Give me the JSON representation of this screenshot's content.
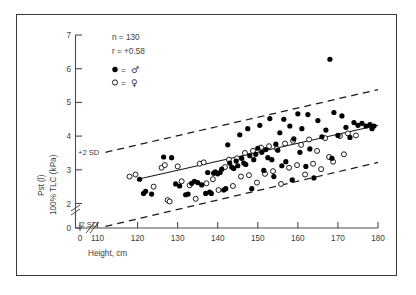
{
  "figure": {
    "background_color": "#ffffff",
    "frame_color": "#3a3a3a"
  },
  "chart_data": {
    "type": "scatter",
    "title": "",
    "xlabel": "Height, cm",
    "ylabel": "Pst (l) 100% TLC (kPa)",
    "xlim": [
      110,
      180
    ],
    "ylim": [
      0,
      7
    ],
    "y_break_between": [
      0,
      2
    ],
    "x_break_between": [
      0,
      110
    ],
    "grid": false,
    "xticks": [
      110,
      120,
      130,
      140,
      150,
      160,
      170,
      180
    ],
    "xtick_labels": [
      "110",
      "120",
      "130",
      "140",
      "150",
      "160",
      "170",
      "180"
    ],
    "x_origin_label": "0",
    "yticks": [
      0,
      2,
      3,
      4,
      5,
      6,
      7
    ],
    "ytick_labels": [
      "0",
      "2",
      "3",
      "4",
      "5",
      "6",
      "7"
    ],
    "annotations": {
      "n_label": "n = 130",
      "r_label": "r = +0.58",
      "upper_band_label": "+2 SD",
      "lower_band_label": "-2 SD"
    },
    "legend": {
      "position": "upper-left-inside",
      "entries": [
        {
          "marker": "filled-circle",
          "symbol": "♂",
          "label": "● = ♂",
          "name": "male"
        },
        {
          "marker": "open-circle",
          "symbol": "♀",
          "label": "○ = ♀",
          "name": "female"
        }
      ]
    },
    "regression_line": {
      "name": "mean-regression",
      "x": [
        120,
        180
      ],
      "y": [
        2.72,
        4.32
      ],
      "style": "solid"
    },
    "sd_bands": [
      {
        "name": "plus-2sd",
        "label": "+2 SD",
        "x": [
          112,
          180
        ],
        "y": [
          3.52,
          5.38
        ],
        "style": "dashed"
      },
      {
        "name": "minus-2sd",
        "label": "-2 SD",
        "x": [
          112,
          180
        ],
        "y": [
          1.32,
          3.22
        ],
        "style": "dashed"
      }
    ],
    "series": [
      {
        "name": "male",
        "marker": "filled-circle",
        "color": "#000000",
        "points": [
          [
            120.5,
            2.72
          ],
          [
            121.5,
            2.3
          ],
          [
            122.0,
            2.36
          ],
          [
            123.5,
            2.28
          ],
          [
            126.5,
            3.38
          ],
          [
            128.5,
            3.36
          ],
          [
            129.5,
            2.58
          ],
          [
            130.5,
            2.52
          ],
          [
            132.0,
            2.26
          ],
          [
            132.6,
            2.28
          ],
          [
            133.5,
            2.6
          ],
          [
            134.2,
            2.66
          ],
          [
            135.0,
            2.62
          ],
          [
            136.0,
            2.55
          ],
          [
            137.0,
            2.3
          ],
          [
            137.5,
            2.92
          ],
          [
            138.0,
            2.34
          ],
          [
            138.4,
            2.3
          ],
          [
            139.0,
            2.9
          ],
          [
            139.4,
            2.94
          ],
          [
            140.0,
            2.88
          ],
          [
            140.6,
            2.92
          ],
          [
            141.0,
            3.02
          ],
          [
            141.5,
            2.4
          ],
          [
            142.0,
            2.44
          ],
          [
            142.5,
            3.74
          ],
          [
            143.0,
            3.2
          ],
          [
            143.5,
            3.08
          ],
          [
            144.0,
            3.04
          ],
          [
            144.6,
            3.26
          ],
          [
            145.0,
            3.12
          ],
          [
            145.5,
            4.04
          ],
          [
            146.0,
            3.34
          ],
          [
            146.5,
            3.2
          ],
          [
            147.0,
            3.16
          ],
          [
            147.5,
            4.22
          ],
          [
            148.0,
            3.42
          ],
          [
            148.5,
            2.44
          ],
          [
            149.0,
            3.3
          ],
          [
            149.5,
            3.46
          ],
          [
            150.0,
            3.64
          ],
          [
            150.5,
            4.32
          ],
          [
            151.0,
            3.52
          ],
          [
            151.5,
            2.98
          ],
          [
            152.0,
            3.6
          ],
          [
            152.5,
            3.36
          ],
          [
            153.0,
            4.52
          ],
          [
            153.5,
            3.3
          ],
          [
            154.0,
            2.8
          ],
          [
            154.5,
            3.76
          ],
          [
            155.0,
            3.58
          ],
          [
            155.5,
            4.1
          ],
          [
            156.0,
            3.12
          ],
          [
            156.5,
            4.5
          ],
          [
            157.0,
            3.24
          ],
          [
            158.0,
            4.3
          ],
          [
            158.6,
            2.7
          ],
          [
            159.0,
            3.92
          ],
          [
            160.0,
            4.66
          ],
          [
            160.5,
            3.52
          ],
          [
            161.0,
            4.22
          ],
          [
            162.0,
            3.1
          ],
          [
            162.5,
            4.64
          ],
          [
            163.0,
            3.62
          ],
          [
            164.0,
            2.76
          ],
          [
            165.0,
            4.46
          ],
          [
            166.0,
            3.98
          ],
          [
            167.0,
            4.18
          ],
          [
            168.0,
            6.28
          ],
          [
            168.5,
            3.34
          ],
          [
            169.0,
            4.7
          ],
          [
            170.0,
            4.02
          ],
          [
            171.0,
            4.6
          ],
          [
            172.0,
            4.26
          ],
          [
            173.0,
            3.96
          ],
          [
            174.0,
            4.4
          ],
          [
            175.0,
            4.32
          ],
          [
            176.0,
            4.38
          ],
          [
            177.0,
            4.3
          ],
          [
            178.0,
            4.34
          ],
          [
            178.5,
            4.22
          ],
          [
            179.0,
            4.3
          ]
        ]
      },
      {
        "name": "female",
        "marker": "open-circle",
        "color": "#ffffff",
        "points": [
          [
            118.0,
            2.8
          ],
          [
            119.5,
            2.86
          ],
          [
            124.0,
            2.5
          ],
          [
            126.0,
            3.06
          ],
          [
            126.8,
            3.14
          ],
          [
            127.5,
            2.1
          ],
          [
            128.0,
            2.06
          ],
          [
            130.0,
            3.1
          ],
          [
            131.0,
            2.66
          ],
          [
            133.0,
            2.54
          ],
          [
            134.5,
            2.14
          ],
          [
            135.5,
            3.18
          ],
          [
            136.5,
            3.22
          ],
          [
            137.2,
            2.6
          ],
          [
            138.8,
            2.72
          ],
          [
            140.2,
            2.4
          ],
          [
            141.8,
            3.08
          ],
          [
            142.8,
            3.3
          ],
          [
            143.8,
            2.52
          ],
          [
            144.8,
            3.34
          ],
          [
            145.8,
            2.8
          ],
          [
            146.8,
            3.5
          ],
          [
            147.8,
            2.84
          ],
          [
            148.8,
            3.56
          ],
          [
            149.8,
            2.62
          ],
          [
            150.8,
            3.66
          ],
          [
            151.8,
            2.88
          ],
          [
            152.8,
            3.7
          ],
          [
            153.8,
            2.96
          ],
          [
            154.8,
            3.62
          ],
          [
            155.8,
            2.58
          ],
          [
            156.8,
            3.78
          ],
          [
            157.8,
            3.06
          ],
          [
            158.8,
            3.86
          ],
          [
            159.8,
            3.14
          ],
          [
            160.8,
            3.74
          ],
          [
            161.8,
            2.86
          ],
          [
            162.8,
            3.9
          ],
          [
            163.8,
            3.18
          ],
          [
            164.8,
            3.56
          ],
          [
            165.8,
            3.02
          ],
          [
            166.8,
            3.94
          ],
          [
            167.8,
            3.38
          ],
          [
            168.8,
            3.24
          ],
          [
            170.5,
            4.0
          ],
          [
            171.5,
            3.46
          ],
          [
            172.5,
            4.08
          ],
          [
            174.5,
            4.02
          ]
        ]
      }
    ]
  }
}
